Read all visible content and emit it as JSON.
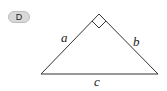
{
  "badge": {
    "label": "D"
  },
  "diagram": {
    "type": "right-triangle",
    "sides": {
      "a": "a",
      "b": "b",
      "c": "c"
    },
    "right_angle_at": "apex between a and b",
    "line_color": "#333333"
  }
}
